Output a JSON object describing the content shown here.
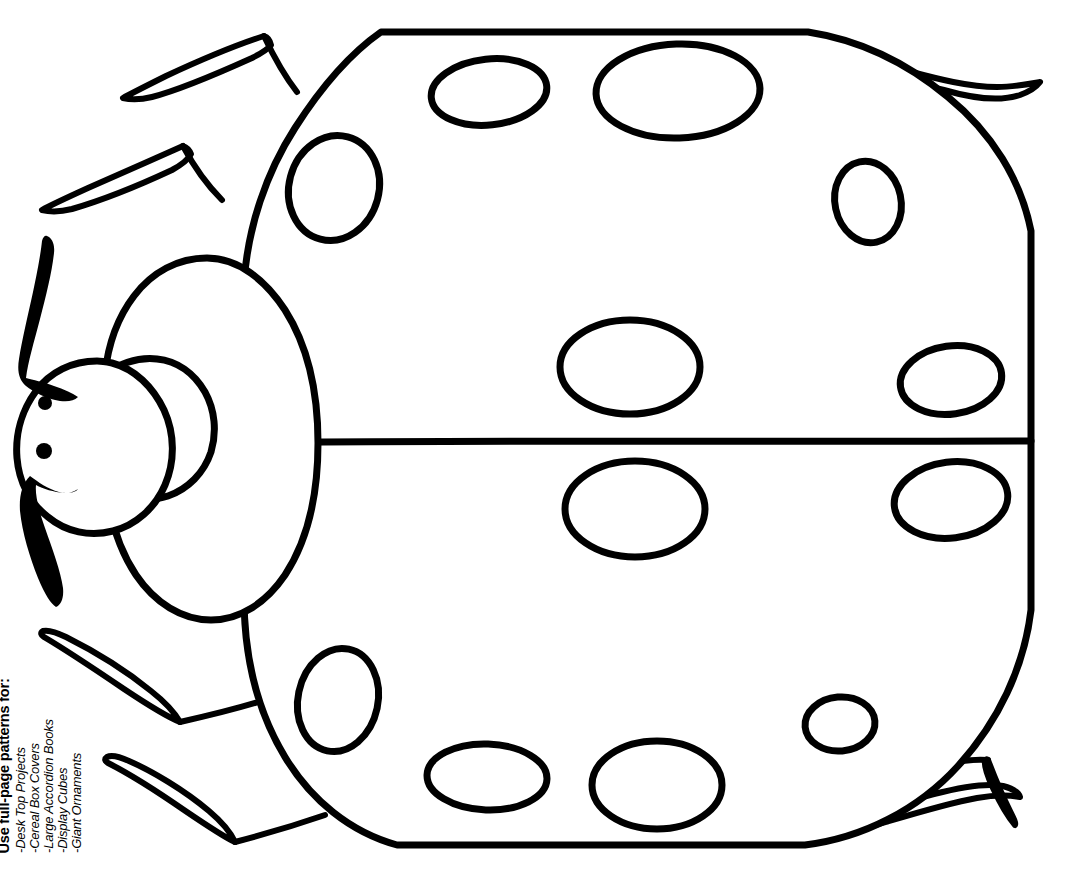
{
  "page": {
    "width": 1074,
    "height": 875,
    "background_color": "#ffffff",
    "ink_color": "#000000"
  },
  "caption": {
    "heading": "Use full-page patterns for:",
    "items": [
      "-Desk Top Projects",
      "-Cereal Box Covers",
      "-Large Accordion Books",
      "-Display Cubes",
      "-Giant Ornaments"
    ]
  },
  "artwork": {
    "subject": "ladybug",
    "style": "black outline line-art coloring pattern",
    "stroke_color": "#000000",
    "fill_color": "#ffffff",
    "parts": {
      "body": "rounded-polygon shell with flat top and bottom edges",
      "wing_split_line": "horizontal line across middle of shell",
      "pronotum": "large oval thorax behind head",
      "head": "circle with two filled eye dots",
      "antennae_count": 2,
      "legs_count": 6,
      "spots_count": 12
    },
    "eyes": [
      {
        "cx": 45,
        "cy": 403,
        "r": 7
      },
      {
        "cx": 44,
        "cy": 451,
        "r": 8
      }
    ],
    "spots": [
      {
        "cx": 489,
        "cy": 92,
        "rx": 58,
        "ry": 33,
        "rot": -6
      },
      {
        "cx": 678,
        "cy": 91,
        "rx": 82,
        "ry": 47,
        "rot": -2
      },
      {
        "cx": 334,
        "cy": 188,
        "rx": 45,
        "ry": 53,
        "rot": 15
      },
      {
        "cx": 868,
        "cy": 202,
        "rx": 33,
        "ry": 41,
        "rot": -12
      },
      {
        "cx": 630,
        "cy": 367,
        "rx": 70,
        "ry": 47,
        "rot": 0
      },
      {
        "cx": 951,
        "cy": 380,
        "rx": 51,
        "ry": 34,
        "rot": -8
      },
      {
        "cx": 635,
        "cy": 509,
        "rx": 70,
        "ry": 48,
        "rot": 0
      },
      {
        "cx": 951,
        "cy": 500,
        "rx": 57,
        "ry": 38,
        "rot": -7
      },
      {
        "cx": 338,
        "cy": 700,
        "rx": 40,
        "ry": 52,
        "rot": 12
      },
      {
        "cx": 840,
        "cy": 724,
        "rx": 35,
        "ry": 27,
        "rot": -5
      },
      {
        "cx": 487,
        "cy": 777,
        "rx": 60,
        "ry": 33,
        "rot": 2
      },
      {
        "cx": 657,
        "cy": 785,
        "rx": 65,
        "ry": 44,
        "rot": 0
      }
    ]
  }
}
